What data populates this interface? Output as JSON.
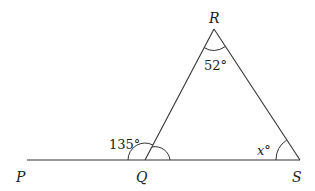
{
  "diagram": {
    "type": "geometry",
    "points": {
      "P": {
        "label": "P"
      },
      "Q": {
        "label": "Q"
      },
      "R": {
        "label": "R"
      },
      "S": {
        "label": "S"
      }
    },
    "angles": {
      "R": {
        "label": "52°",
        "value": "52",
        "unit": "°"
      },
      "PQR_exterior": {
        "label": "135°",
        "value": "135",
        "unit": "°"
      },
      "S": {
        "label": "x°",
        "value": "x",
        "unit": "°"
      }
    },
    "colors": {
      "stroke": "#333333",
      "text": "#222222",
      "background": "#ffffff"
    }
  }
}
